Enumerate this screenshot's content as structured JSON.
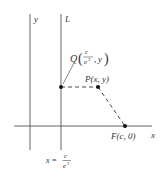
{
  "diagram": {
    "axes": {
      "x_label": "x",
      "y_label": "y"
    },
    "lines": {
      "directrix_label": "L",
      "directrix_equation": {
        "lhs": "x =",
        "numerator": "c",
        "denominator_base": "e",
        "denominator_exp": "2"
      }
    },
    "points": {
      "Q": {
        "name": "Q",
        "x_numerator": "c",
        "x_denominator_base": "e",
        "x_denominator_exp": "2",
        "y": "y",
        "open_paren": "(",
        "close_paren": ")",
        "comma": ","
      },
      "P": {
        "label": "P(x, y)"
      },
      "F": {
        "label": "F(c, 0)"
      }
    },
    "colors": {
      "stroke": "#555555",
      "point": "#111111",
      "text": "#333333",
      "background": "#ffffff"
    }
  }
}
